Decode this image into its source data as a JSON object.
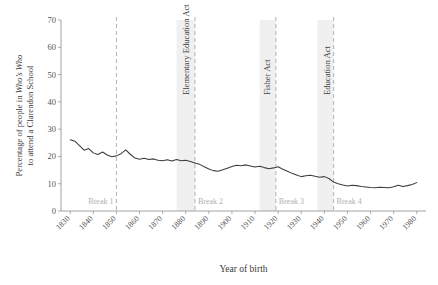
{
  "chart_data": {
    "type": "line",
    "title": "",
    "xlabel": "Year of birth",
    "ylabel_line1": "Percentage of people in ",
    "ylabel_italic": "Who’s Who",
    "ylabel_line2": "to attend a Clarendon School",
    "xlim": [
      1826,
      1984
    ],
    "ylim": [
      0,
      70
    ],
    "yticks": [
      0,
      10,
      20,
      30,
      40,
      50,
      60,
      70
    ],
    "xticks": [
      1830,
      1840,
      1850,
      1860,
      1870,
      1880,
      1890,
      1900,
      1910,
      1920,
      1930,
      1940,
      1950,
      1960,
      1970,
      1980
    ],
    "grid": false,
    "legend": "none",
    "line_color": "#3c3c3c",
    "break_color": "#b9b9b9",
    "band_color": "#f0f0f0",
    "breaks": [
      {
        "label": "Break 1",
        "x": 1850,
        "label_side": "left"
      },
      {
        "label": "Break 2",
        "x": 1884,
        "label_side": "right"
      },
      {
        "label": "Break 3",
        "x": 1919,
        "label_side": "right"
      },
      {
        "label": "Break 4",
        "x": 1944,
        "label_side": "right"
      }
    ],
    "annotations": [
      {
        "text": "Elementary Education Act",
        "x": 1880,
        "band": [
          1876,
          1884
        ]
      },
      {
        "text": "Fisher Act",
        "x": 1915,
        "band": [
          1912,
          1919
        ]
      },
      {
        "text": "Education Act",
        "x": 1941,
        "band": [
          1937,
          1944
        ]
      }
    ],
    "x": [
      1830,
      1832,
      1834,
      1836,
      1838,
      1840,
      1842,
      1844,
      1846,
      1848,
      1850,
      1852,
      1854,
      1856,
      1858,
      1860,
      1862,
      1864,
      1866,
      1868,
      1870,
      1872,
      1874,
      1876,
      1878,
      1880,
      1882,
      1884,
      1886,
      1888,
      1890,
      1892,
      1894,
      1896,
      1898,
      1900,
      1902,
      1904,
      1906,
      1908,
      1910,
      1912,
      1914,
      1916,
      1918,
      1920,
      1922,
      1924,
      1926,
      1928,
      1930,
      1932,
      1934,
      1936,
      1938,
      1940,
      1942,
      1944,
      1946,
      1948,
      1950,
      1952,
      1954,
      1956,
      1958,
      1960,
      1962,
      1964,
      1966,
      1968,
      1970,
      1972,
      1974,
      1976,
      1978,
      1980
    ],
    "values": [
      26.1,
      25.6,
      24.0,
      22.3,
      22.9,
      21.3,
      20.7,
      21.6,
      20.5,
      19.9,
      20.2,
      21.0,
      22.4,
      20.8,
      19.4,
      19.0,
      19.3,
      18.9,
      19.1,
      18.6,
      18.4,
      18.8,
      18.3,
      18.9,
      18.4,
      18.6,
      18.1,
      17.6,
      17.1,
      16.2,
      15.4,
      14.8,
      14.6,
      15.1,
      15.7,
      16.3,
      16.8,
      16.6,
      16.9,
      16.5,
      16.1,
      16.4,
      15.9,
      15.5,
      15.8,
      16.2,
      15.3,
      14.6,
      13.8,
      13.2,
      12.6,
      12.9,
      13.1,
      12.7,
      12.4,
      12.6,
      11.9,
      10.6,
      10.0,
      9.5,
      9.2,
      9.4,
      9.3,
      9.0,
      8.8,
      8.6,
      8.5,
      8.7,
      8.6,
      8.5,
      8.9,
      9.4,
      9.0,
      9.3,
      9.7,
      10.4
    ]
  }
}
